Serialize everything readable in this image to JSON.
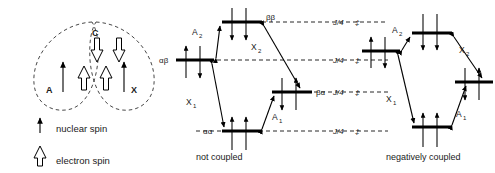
{
  "figure": {
    "stroke_color": "#000000",
    "dash_color": "#111111",
    "text_color": "#1a1a1a"
  },
  "left_panel": {
    "name": "molecular-spin-schematic",
    "atoms": [
      {
        "key": "A",
        "label": "A"
      },
      {
        "key": "C",
        "label": "C"
      },
      {
        "key": "X",
        "label": "X"
      }
    ],
    "nuclear_spins": [
      {
        "key": "A-nuclear",
        "direction": "up"
      },
      {
        "key": "X-nuclear",
        "direction": "up"
      }
    ],
    "electron_spins": [
      {
        "key": "A-electron",
        "direction": "up"
      },
      {
        "key": "C-electron-left",
        "direction": "down"
      },
      {
        "key": "C-electron-right",
        "direction": "down"
      },
      {
        "key": "X-electron",
        "direction": "up"
      }
    ]
  },
  "legend": {
    "name": "legend",
    "items": [
      {
        "key": "nuclear",
        "label": "nuclear spin",
        "glyph": "thin-arrow-up"
      },
      {
        "key": "electron",
        "label": "electron spin",
        "glyph": "hollow-arrow-up"
      }
    ]
  },
  "panels": [
    {
      "key": "not-coupled",
      "caption": "not coupled",
      "levels": [
        {
          "key": "bb",
          "label": "ββ",
          "label_side": "right",
          "spins": [
            "down",
            "down"
          ]
        },
        {
          "key": "ab",
          "label": "αβ",
          "label_side": "left",
          "spins": [
            "up",
            "down"
          ]
        },
        {
          "key": "ba",
          "label": "βα",
          "label_side": "right",
          "spins": [
            "down",
            "up"
          ]
        },
        {
          "key": "aa",
          "label": "αα",
          "label_side": "left",
          "spins": [
            "up",
            "up"
          ]
        }
      ],
      "transitions": [
        {
          "key": "A2",
          "label": "A",
          "sub": "2"
        },
        {
          "key": "X2",
          "label": "X",
          "sub": "2"
        },
        {
          "key": "X1",
          "label": "X",
          "sub": "1"
        },
        {
          "key": "A1",
          "label": "A",
          "sub": "1"
        }
      ]
    },
    {
      "key": "negatively-coupled",
      "caption": "negatively coupled",
      "levels": [
        {
          "key": "bb",
          "label": "",
          "label_side": "none",
          "spins": [
            "down",
            "down"
          ]
        },
        {
          "key": "ab",
          "label": "",
          "label_side": "none",
          "spins": [
            "up",
            "down"
          ]
        },
        {
          "key": "ba",
          "label": "",
          "label_side": "none",
          "spins": [
            "down",
            "up"
          ]
        },
        {
          "key": "aa",
          "label": "",
          "label_side": "none",
          "spins": [
            "up",
            "up"
          ]
        }
      ],
      "transitions": [
        {
          "key": "A2",
          "label": "A",
          "sub": "2"
        },
        {
          "key": "X2",
          "label": "X",
          "sub": "2"
        },
        {
          "key": "X1",
          "label": "X",
          "sub": "1"
        },
        {
          "key": "A1",
          "label": "A",
          "sub": "1"
        }
      ]
    }
  ],
  "energy_labels": {
    "name": "coupling-energy-labels",
    "items": [
      {
        "key": "j-bb",
        "text": "J/4",
        "marker": "‡"
      },
      {
        "key": "j-ab",
        "text": "J/4",
        "marker": "‡"
      },
      {
        "key": "j-ba",
        "text": "J/4",
        "marker": "‡"
      },
      {
        "key": "j-aa",
        "text": "J/4",
        "marker": "‡"
      }
    ]
  }
}
